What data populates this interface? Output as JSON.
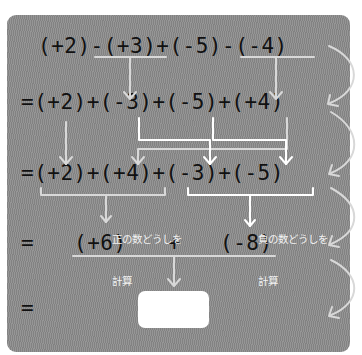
{
  "colors": {
    "panel_bg": "#8a8a8a",
    "text": "#111111",
    "guide_line": "#d8d8d8",
    "highlight_line": "#ffffff",
    "answer_box": "#ffffff"
  },
  "lines": [
    {
      "id": "line1",
      "text": "(+2)-(+3)+(-5)-(-4)"
    },
    {
      "id": "line2",
      "text": "=(+2)+(-3)+(-5)+(+4)"
    },
    {
      "id": "line3",
      "text": "=(+2)+(+4)+(-3)+(-5)"
    },
    {
      "id": "line4_eq",
      "text": "="
    },
    {
      "id": "line4_pos",
      "text": "(+6)"
    },
    {
      "id": "line4_plus",
      "text": "+"
    },
    {
      "id": "line4_neg",
      "text": "(-8)"
    },
    {
      "id": "line5_eq",
      "text": "="
    }
  ],
  "labels": {
    "positive": {
      "line1": "正の数どうしを",
      "line2": "計算"
    },
    "negative": {
      "line1": "負の数どうしを",
      "line2": "計算"
    }
  },
  "answer_box": {
    "value": ""
  },
  "icons": [
    "down-arrow-icon",
    "curved-arrow-icon",
    "bracket-icon"
  ]
}
